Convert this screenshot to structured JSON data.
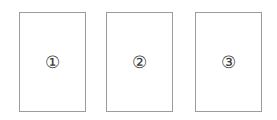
{
  "canvas": {
    "width": 277,
    "height": 120,
    "background_color": "#ffffff"
  },
  "style": {
    "panel_border_color": "#9c9c9c",
    "panel_fill_color": "#ffffff",
    "label_color": "#3a3a3a"
  },
  "panels": [
    {
      "id": "panel-1",
      "label": "①",
      "label_text": "circled-digit-one",
      "number": 1
    },
    {
      "id": "panel-2",
      "label": "②",
      "label_text": "circled-digit-two",
      "number": 2
    },
    {
      "id": "panel-3",
      "label": "③",
      "label_text": "circled-digit-three",
      "number": 3
    }
  ]
}
